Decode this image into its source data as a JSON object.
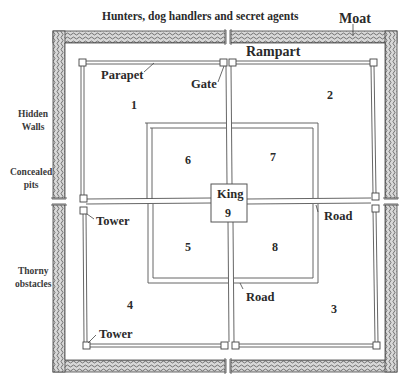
{
  "diagram": {
    "title": "Hunters, dog handlers and secret agents",
    "labels": {
      "moat": "Moat",
      "rampart": "Rampart",
      "parapet": "Parapet",
      "gate": "Gate",
      "hidden_walls": "Hidden\nWalls",
      "concealed_pits": "Concealed\npits",
      "thorny_obstacles": "Thorny\nobstacles",
      "tower_upper": "Tower",
      "tower_lower": "Tower",
      "road_right": "Road",
      "road_lower": "Road",
      "king": "King"
    },
    "zones": [
      {
        "id": "1",
        "label": "1"
      },
      {
        "id": "2",
        "label": "2"
      },
      {
        "id": "3",
        "label": "3"
      },
      {
        "id": "4",
        "label": "4"
      },
      {
        "id": "5",
        "label": "5"
      },
      {
        "id": "6",
        "label": "6"
      },
      {
        "id": "7",
        "label": "7"
      },
      {
        "id": "8",
        "label": "8"
      },
      {
        "id": "9",
        "label": "9"
      }
    ],
    "colors": {
      "line": "#555555",
      "moat_fill": "#9a9a9a",
      "background": "#ffffff"
    }
  }
}
